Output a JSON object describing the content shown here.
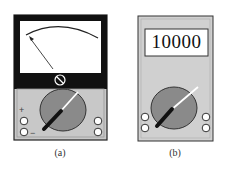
{
  "figure": {
    "panels": [
      {
        "id": "a",
        "type": "analog-multimeter",
        "caption": "(a)",
        "terminal_labels": {
          "plus": "+",
          "minus": "−"
        }
      },
      {
        "id": "b",
        "type": "digital-multimeter",
        "caption": "(b)",
        "display_value": "10000"
      }
    ],
    "colors": {
      "body_gray": "#c8c8c8",
      "dial_gray": "#8a8a8a",
      "frame_black": "#111111",
      "screen_white": "#ffffff"
    }
  }
}
